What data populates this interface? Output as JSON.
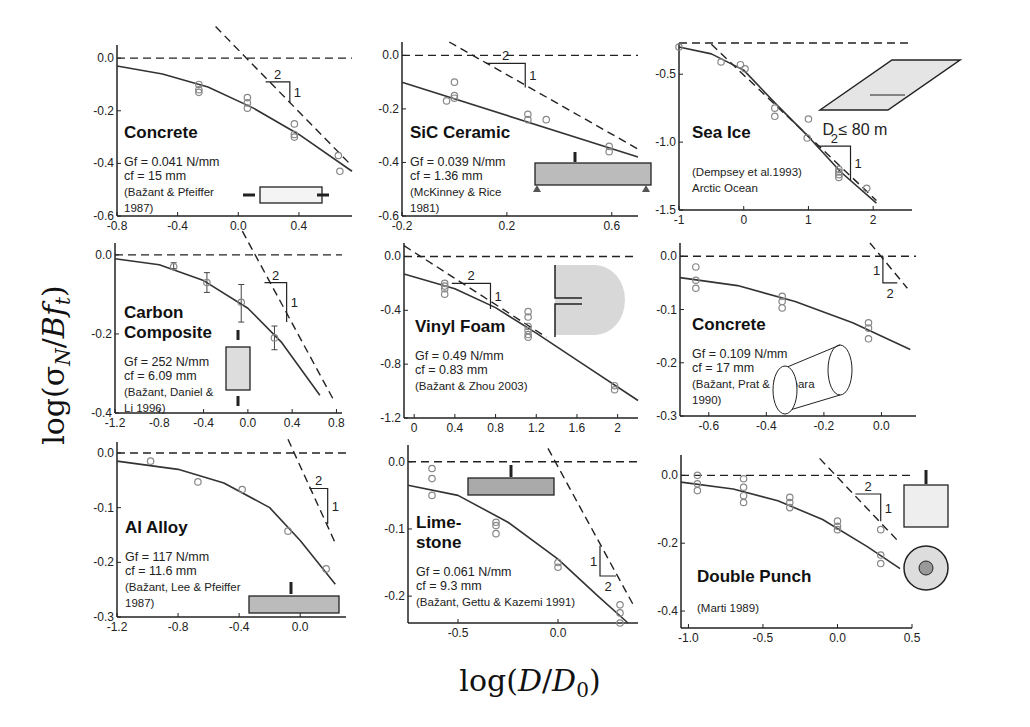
{
  "figure": {
    "ylabel": "log(σN / B ft)",
    "xlabel": "log(D/D0)"
  },
  "chart_data": [
    {
      "type": "scatter",
      "title": "Concrete",
      "params": [
        "Gf = 0.041 N/mm",
        "cf = 15 mm"
      ],
      "source": [
        "(Bažant & Pfeiffer",
        "1987)"
      ],
      "xlim": [
        -0.8,
        0.75
      ],
      "ylim": [
        -0.6,
        0.05
      ],
      "xticks": [
        -0.8,
        -0.4,
        0.0,
        0.4
      ],
      "yticks": [
        0.0,
        -0.2,
        -0.4,
        -0.6
      ],
      "points": [
        [
          -0.26,
          -0.1
        ],
        [
          -0.26,
          -0.12
        ],
        [
          -0.26,
          -0.13
        ],
        [
          0.06,
          -0.15
        ],
        [
          0.06,
          -0.17
        ],
        [
          0.06,
          -0.19
        ],
        [
          0.37,
          -0.25
        ],
        [
          0.37,
          -0.29
        ],
        [
          0.37,
          -0.3
        ],
        [
          0.66,
          -0.37
        ],
        [
          0.67,
          -0.43
        ]
      ],
      "curve": [
        [
          -0.8,
          -0.03
        ],
        [
          -0.5,
          -0.06
        ],
        [
          -0.2,
          -0.11
        ],
        [
          0.1,
          -0.19
        ],
        [
          0.4,
          -0.29
        ],
        [
          0.75,
          -0.43
        ]
      ],
      "asymptote": [
        [
          -0.15,
          0.12
        ],
        [
          0.75,
          -0.41
        ]
      ],
      "slope": {
        "x": 0.18,
        "y": -0.09,
        "w": 0.16,
        "h": 0.08,
        "run": "2",
        "rise": "1"
      },
      "specimen": "notched-compression-block"
    },
    {
      "type": "scatter",
      "title": "SiC Ceramic",
      "params": [
        "Gf = 0.039 N/mm",
        "cf = 1.36 mm"
      ],
      "source": [
        "(McKinney & Rice",
        "1981)"
      ],
      "xlim": [
        -0.2,
        0.7
      ],
      "ylim": [
        -0.6,
        0.05
      ],
      "xticks": [
        -0.2,
        0.2,
        0.6
      ],
      "yticks": [
        0.0,
        -0.2,
        -0.4,
        -0.6
      ],
      "points": [
        [
          -0.03,
          -0.17
        ],
        [
          0.0,
          -0.1
        ],
        [
          0.0,
          -0.15
        ],
        [
          0.0,
          -0.16
        ],
        [
          0.28,
          -0.22
        ],
        [
          0.28,
          -0.24
        ],
        [
          0.35,
          -0.24
        ],
        [
          0.59,
          -0.34
        ],
        [
          0.59,
          -0.36
        ]
      ],
      "curve": [
        [
          -0.2,
          -0.1
        ],
        [
          0.7,
          -0.38
        ]
      ],
      "asymptote": [
        [
          -0.02,
          0.05
        ],
        [
          0.7,
          -0.35
        ]
      ],
      "slope": {
        "x": 0.12,
        "y": -0.03,
        "w": 0.15,
        "h": 0.09,
        "run": "2",
        "rise": "1"
      },
      "specimen": "three-point-bend-beam"
    },
    {
      "type": "scatter",
      "title": "Sea Ice",
      "params": [],
      "source": [
        "(Dempsey et al.1993)",
        "Arctic Ocean"
      ],
      "annotation": "D ≤ 80 m",
      "xlim": [
        -1,
        2.6
      ],
      "ylim": [
        -1.5,
        -0.27
      ],
      "xticks": [
        -1,
        0,
        1,
        2
      ],
      "yticks": [
        -0.5,
        -1.0,
        -1.5
      ],
      "points": [
        [
          -1.0,
          -0.3
        ],
        [
          -0.35,
          -0.41
        ],
        [
          -0.05,
          -0.43
        ],
        [
          0.02,
          -0.46
        ],
        [
          0.48,
          -0.75
        ],
        [
          0.48,
          -0.81
        ],
        [
          1.0,
          -0.83
        ],
        [
          0.98,
          -0.97
        ],
        [
          1.47,
          -1.2
        ],
        [
          1.47,
          -1.22
        ],
        [
          1.47,
          -1.24
        ],
        [
          1.47,
          -1.26
        ],
        [
          1.9,
          -1.34
        ]
      ],
      "curve": [
        [
          -1.0,
          -0.3
        ],
        [
          -0.5,
          -0.35
        ],
        [
          0.0,
          -0.47
        ],
        [
          0.5,
          -0.72
        ],
        [
          1.0,
          -0.96
        ],
        [
          1.5,
          -1.22
        ],
        [
          2.05,
          -1.45
        ]
      ],
      "asymptote": [
        [
          -0.5,
          -0.28
        ],
        [
          2.05,
          -1.43
        ]
      ],
      "slope": {
        "x": 1.15,
        "y": -1.03,
        "w": 0.5,
        "h": 0.25,
        "run": "2",
        "rise": "1"
      },
      "specimen": "ice-plate"
    },
    {
      "type": "scatter",
      "title": "Carbon Composite",
      "title_lines": [
        "Carbon",
        "Composite"
      ],
      "params": [
        "Gf = 252 N/mm",
        "cf = 6.09 mm"
      ],
      "source": [
        "(Bažant, Daniel &",
        "Li 1996)"
      ],
      "xlim": [
        -1.2,
        0.85
      ],
      "ylim": [
        -0.4,
        0.03
      ],
      "xticks": [
        -1.2,
        -0.8,
        -0.4,
        0.0,
        0.4,
        0.8
      ],
      "yticks": [
        0.0,
        -0.2,
        -0.4
      ],
      "points": [
        [
          -0.67,
          -0.03
        ],
        [
          -0.37,
          -0.07
        ],
        [
          -0.06,
          -0.12
        ],
        [
          0.24,
          -0.21
        ]
      ],
      "errorbars": [
        [
          -0.67,
          -0.02,
          -0.035
        ],
        [
          -0.37,
          -0.045,
          -0.095
        ],
        [
          -0.06,
          -0.075,
          -0.17
        ],
        [
          0.24,
          -0.18,
          -0.24
        ]
      ],
      "curve": [
        [
          -1.2,
          -0.01
        ],
        [
          -0.8,
          -0.025
        ],
        [
          -0.4,
          -0.065
        ],
        [
          0.0,
          -0.135
        ],
        [
          0.3,
          -0.22
        ],
        [
          0.65,
          -0.355
        ]
      ],
      "asymptote": [
        [
          -0.05,
          0.06
        ],
        [
          0.78,
          -0.37
        ]
      ],
      "slope": {
        "x": 0.15,
        "y": -0.07,
        "w": 0.2,
        "h": 0.1,
        "run": "2",
        "rise": "1"
      },
      "specimen": "notched-tension-specimen"
    },
    {
      "type": "scatter",
      "title": "Vinyl Foam",
      "params": [
        "Gf = 0.49 N/mm",
        "cf = 0.83 mm"
      ],
      "source": [
        "(Bažant & Zhou 2003)"
      ],
      "xlim": [
        -0.1,
        2.2
      ],
      "ylim": [
        -1.2,
        0.1
      ],
      "xticks": [
        0.0,
        0.4,
        0.8,
        1.2,
        1.6,
        2.0
      ],
      "yticks": [
        0.0,
        -0.4,
        -0.8,
        -1.2
      ],
      "points": [
        [
          0.3,
          -0.2
        ],
        [
          0.3,
          -0.22
        ],
        [
          0.3,
          -0.24
        ],
        [
          0.3,
          -0.28
        ],
        [
          1.12,
          -0.41
        ],
        [
          1.12,
          -0.45
        ],
        [
          1.12,
          -0.52
        ],
        [
          1.12,
          -0.55
        ],
        [
          1.12,
          -0.58
        ],
        [
          1.12,
          -0.6
        ],
        [
          1.97,
          -0.96
        ],
        [
          1.97,
          -0.99
        ]
      ],
      "curve": [
        [
          -0.1,
          -0.13
        ],
        [
          0.4,
          -0.24
        ],
        [
          0.8,
          -0.38
        ],
        [
          1.2,
          -0.57
        ],
        [
          1.6,
          -0.77
        ],
        [
          2.2,
          -1.07
        ]
      ],
      "asymptote": [
        [
          -0.1,
          0.08
        ],
        [
          1.3,
          -0.6
        ]
      ],
      "slope": {
        "x": 0.37,
        "y": -0.2,
        "w": 0.38,
        "h": 0.19,
        "run": "2",
        "rise": "1"
      },
      "specimen": "notched-foam-specimen"
    },
    {
      "type": "scatter",
      "title": "Concrete",
      "params": [
        "Gf = 0.109 N/mm",
        "cf = 17 mm"
      ],
      "source": [
        "(Bažant, Prat & Tabbara",
        "1990)"
      ],
      "xlim": [
        -0.7,
        0.12
      ],
      "ylim": [
        -0.3,
        0.025
      ],
      "xticks": [
        -0.6,
        -0.4,
        -0.2,
        0.0
      ],
      "yticks": [
        0.0,
        -0.1,
        -0.2,
        -0.3
      ],
      "points": [
        [
          -0.645,
          -0.02
        ],
        [
          -0.645,
          -0.045
        ],
        [
          -0.645,
          -0.06
        ],
        [
          -0.345,
          -0.075
        ],
        [
          -0.345,
          -0.085
        ],
        [
          -0.345,
          -0.097
        ],
        [
          -0.045,
          -0.125
        ],
        [
          -0.045,
          -0.135
        ],
        [
          -0.045,
          -0.155
        ]
      ],
      "curve": [
        [
          -0.7,
          -0.04
        ],
        [
          -0.5,
          -0.055
        ],
        [
          -0.3,
          -0.085
        ],
        [
          -0.1,
          -0.125
        ],
        [
          0.1,
          -0.175
        ]
      ],
      "asymptote": [
        [
          -0.04,
          0.025
        ],
        [
          0.09,
          -0.06
        ]
      ],
      "slope": {
        "x": 0.005,
        "y": 0.0,
        "w": 0.05,
        "h": 0.05,
        "run": "2",
        "rise": "1",
        "inverted": true
      },
      "specimen": "cylinder-specimen"
    },
    {
      "type": "scatter",
      "title": "Al Alloy",
      "params": [
        "Gf = 117 N/mm",
        "cf = 11.6 mm"
      ],
      "source": [
        "(Bažant, Lee & Pfeiffer",
        "1987)"
      ],
      "xlim": [
        -1.2,
        0.3
      ],
      "ylim": [
        -0.3,
        0.02
      ],
      "xticks": [
        -1.2,
        -0.8,
        -0.4,
        0.0
      ],
      "yticks": [
        0.0,
        -0.1,
        -0.2,
        -0.3
      ],
      "points": [
        [
          -0.98,
          -0.015
        ],
        [
          -0.67,
          -0.053
        ],
        [
          -0.38,
          -0.067
        ],
        [
          -0.08,
          -0.143
        ],
        [
          0.17,
          -0.212
        ]
      ],
      "curve": [
        [
          -1.2,
          -0.015
        ],
        [
          -0.8,
          -0.03
        ],
        [
          -0.5,
          -0.055
        ],
        [
          -0.2,
          -0.1
        ],
        [
          0.0,
          -0.16
        ],
        [
          0.23,
          -0.24
        ]
      ],
      "asymptote": [
        [
          -0.08,
          0.025
        ],
        [
          0.23,
          -0.165
        ]
      ],
      "slope": {
        "x": 0.06,
        "y": -0.065,
        "w": 0.12,
        "h": 0.065,
        "run": "2",
        "rise": "1"
      },
      "specimen": "three-point-bend-beam"
    },
    {
      "type": "scatter",
      "title": "Limestone",
      "title_lines": [
        "Lime-",
        "stone"
      ],
      "params": [
        "Gf = 0.061 N/mm",
        "cf = 9.3 mm"
      ],
      "source": [
        "(Bažant, Gettu & Kazemi 1991)"
      ],
      "xlim": [
        -0.75,
        0.4
      ],
      "ylim": [
        -0.24,
        0.025
      ],
      "xticks": [
        -0.5,
        0.0
      ],
      "yticks": [
        0.0,
        -0.1,
        -0.2
      ],
      "points": [
        [
          -0.63,
          -0.01
        ],
        [
          -0.63,
          -0.025
        ],
        [
          -0.63,
          -0.05
        ],
        [
          -0.31,
          -0.09
        ],
        [
          -0.31,
          -0.095
        ],
        [
          -0.31,
          -0.107
        ],
        [
          0.0,
          -0.15
        ],
        [
          0.0,
          -0.157
        ],
        [
          0.31,
          -0.213
        ],
        [
          0.31,
          -0.225
        ],
        [
          0.31,
          -0.24
        ]
      ],
      "curve": [
        [
          -0.75,
          -0.035
        ],
        [
          -0.5,
          -0.05
        ],
        [
          -0.25,
          -0.09
        ],
        [
          0.0,
          -0.145
        ],
        [
          0.2,
          -0.2
        ],
        [
          0.35,
          -0.24
        ]
      ],
      "asymptote": [
        [
          -0.05,
          0.02
        ],
        [
          0.38,
          -0.215
        ]
      ],
      "slope": {
        "x": 0.21,
        "y": -0.125,
        "w": 0.08,
        "h": 0.045,
        "run": "2",
        "rise": "1",
        "inverted": true
      },
      "specimen": "three-point-bend-beam-stone"
    },
    {
      "type": "scatter",
      "title": "Double Punch",
      "params": [],
      "source": [
        "(Marti 1989)"
      ],
      "xlim": [
        -1.05,
        0.5
      ],
      "ylim": [
        -0.45,
        0.06
      ],
      "xticks": [
        -1.0,
        -0.5,
        0.0,
        0.5
      ],
      "yticks": [
        0.0,
        -0.2,
        -0.4
      ],
      "points": [
        [
          -0.94,
          0.0
        ],
        [
          -0.94,
          -0.025
        ],
        [
          -0.94,
          -0.045
        ],
        [
          -0.63,
          -0.01
        ],
        [
          -0.63,
          -0.035
        ],
        [
          -0.63,
          -0.06
        ],
        [
          -0.63,
          -0.08
        ],
        [
          -0.32,
          -0.065
        ],
        [
          -0.32,
          -0.08
        ],
        [
          -0.32,
          -0.095
        ],
        [
          0.0,
          -0.135
        ],
        [
          0.0,
          -0.15
        ],
        [
          0.0,
          -0.16
        ],
        [
          0.29,
          -0.16
        ],
        [
          0.29,
          -0.235
        ],
        [
          0.29,
          -0.26
        ]
      ],
      "curve": [
        [
          -1.05,
          -0.02
        ],
        [
          -0.7,
          -0.04
        ],
        [
          -0.4,
          -0.075
        ],
        [
          -0.1,
          -0.13
        ],
        [
          0.2,
          -0.21
        ],
        [
          0.42,
          -0.275
        ]
      ],
      "asymptote": [
        [
          -0.12,
          0.05
        ],
        [
          0.42,
          -0.2
        ]
      ],
      "slope": {
        "x": 0.12,
        "y": -0.055,
        "w": 0.17,
        "h": 0.08,
        "run": "2",
        "rise": "1"
      },
      "specimen": "double-punch-cylinder"
    }
  ],
  "layout": {
    "panels": [
      {
        "l": 117,
        "t": 45,
        "r": 352,
        "b": 216
      },
      {
        "l": 402,
        "t": 42,
        "r": 638,
        "b": 216
      },
      {
        "l": 679,
        "t": 43,
        "r": 912,
        "b": 210
      },
      {
        "l": 115,
        "t": 243,
        "r": 342,
        "b": 413
      },
      {
        "l": 404,
        "t": 243,
        "r": 638,
        "b": 418
      },
      {
        "l": 680,
        "t": 243,
        "r": 916,
        "b": 416
      },
      {
        "l": 117,
        "t": 442,
        "r": 346,
        "b": 617
      },
      {
        "l": 408,
        "t": 445,
        "r": 638,
        "b": 623
      },
      {
        "l": 681,
        "t": 455,
        "r": 912,
        "b": 628
      }
    ]
  }
}
